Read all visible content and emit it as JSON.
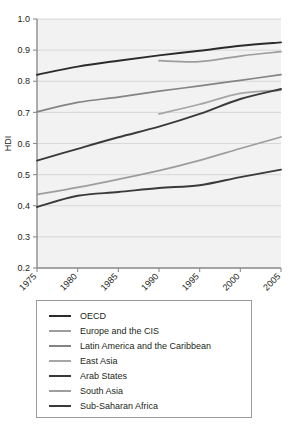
{
  "chart_data": {
    "type": "line",
    "title": "",
    "xlabel": "",
    "ylabel": "HDI",
    "xlim": [
      1975,
      2005
    ],
    "ylim": [
      0.2,
      1.0
    ],
    "grid": true,
    "legend_position": "below",
    "x_ticks": [
      "1975",
      "1980",
      "1985",
      "1990",
      "1995",
      "2000",
      "2005"
    ],
    "y_ticks": [
      "0.2",
      "0.3",
      "0.4",
      "0.5",
      "0.6",
      "0.7",
      "0.8",
      "0.9",
      "1.0"
    ],
    "series": [
      {
        "name": "OECD",
        "color": "#2b2b2b",
        "width": 1.9,
        "x": [
          1975,
          1980,
          1985,
          1990,
          1995,
          2000,
          2005
        ],
        "values": [
          0.821,
          0.847,
          0.866,
          0.883,
          0.898,
          0.914,
          0.925
        ]
      },
      {
        "name": "Europe and the CIS",
        "color": "#9d9d9d",
        "width": 1.7,
        "x": [
          1990,
          1995,
          2000,
          2005
        ],
        "values": [
          0.866,
          0.863,
          0.881,
          0.895
        ]
      },
      {
        "name": "Latin America and the Caribbean",
        "color": "#848484",
        "width": 1.7,
        "x": [
          1975,
          1980,
          1985,
          1990,
          1995,
          2000,
          2005
        ],
        "values": [
          0.702,
          0.732,
          0.749,
          0.768,
          0.785,
          0.803,
          0.821
        ]
      },
      {
        "name": "East Asia",
        "color": "#a6a6a6",
        "width": 1.7,
        "x": [
          1990,
          1995,
          2000,
          2005
        ],
        "values": [
          0.695,
          0.726,
          0.761,
          0.771
        ]
      },
      {
        "name": "Arab States",
        "color": "#3a3a3a",
        "width": 1.9,
        "x": [
          1975,
          1980,
          1985,
          1990,
          1995,
          2000,
          2005
        ],
        "values": [
          0.545,
          0.583,
          0.62,
          0.654,
          0.695,
          0.743,
          0.775
        ]
      },
      {
        "name": "South Asia",
        "color": "#9d9d9d",
        "width": 1.7,
        "x": [
          1975,
          1980,
          1985,
          1990,
          1995,
          2000,
          2005
        ],
        "values": [
          0.436,
          0.459,
          0.485,
          0.513,
          0.546,
          0.584,
          0.621
        ]
      },
      {
        "name": "Sub-Saharan Africa",
        "color": "#3a3a3a",
        "width": 1.9,
        "x": [
          1975,
          1980,
          1985,
          1990,
          1995,
          2000,
          2005
        ],
        "values": [
          0.396,
          0.432,
          0.444,
          0.457,
          0.466,
          0.492,
          0.516
        ]
      }
    ]
  },
  "legend": {
    "items": [
      {
        "label": "OECD"
      },
      {
        "label": "Europe and the CIS"
      },
      {
        "label": "Latin America and the Caribbean"
      },
      {
        "label": "East Asia"
      },
      {
        "label": "Arab States"
      },
      {
        "label": "South Asia"
      },
      {
        "label": "Sub-Saharan Africa"
      }
    ]
  },
  "style": {
    "plot_background": "#f2f2f2",
    "gridline_color": "#d0d0d0",
    "axis_color": "#8c8c8c",
    "text_color": "#231f20"
  }
}
